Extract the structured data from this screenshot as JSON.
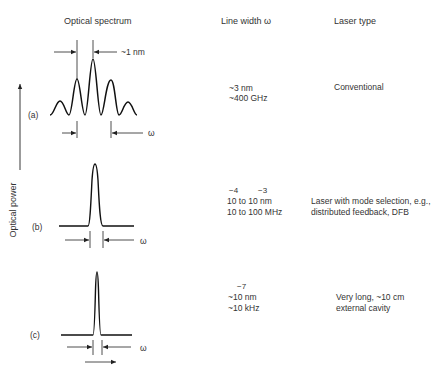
{
  "headers": {
    "spectrum": "Optical spectrum",
    "linewidth": "Line width ω",
    "lasertype": "Laser type"
  },
  "yaxis_label": "Optical power",
  "spacing_label": "~1 nm",
  "omega": "ω",
  "rows": [
    {
      "tag": "(a)",
      "linewidth_lines": [
        "~3 nm",
        "~400 GHz"
      ],
      "exponents": [],
      "laser_type_lines": [
        "Conventional"
      ]
    },
    {
      "tag": "(b)",
      "exponents": [
        "−4",
        "−3"
      ],
      "linewidth_lines": [
        "10 to 10 nm",
        "10 to 100 MHz"
      ],
      "laser_type_lines": [
        "Laser with mode selection, e.g.,",
        "distributed feedback, DFB"
      ]
    },
    {
      "tag": "(c)",
      "exponents": [
        "−7"
      ],
      "linewidth_lines": [
        "~10 nm",
        "~10 kHz"
      ],
      "laser_type_lines": [
        "Very long, ~10 cm",
        "external cavity"
      ]
    }
  ]
}
